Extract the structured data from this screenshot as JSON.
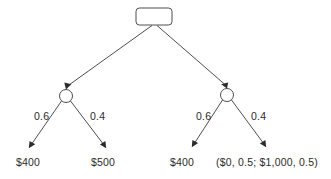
{
  "diagram": {
    "type": "decision-tree",
    "background_color": "#ffffff",
    "line_color": "#3a3a3a",
    "text_color": "#2b2b2b",
    "root": {
      "shape": "rounded-rectangle",
      "role": "decision-node",
      "label": "",
      "x": 154,
      "y": 16.5,
      "width": 36,
      "height": 17
    },
    "chance_nodes": [
      {
        "id": "left-chance-node",
        "shape": "circle",
        "x": 66,
        "y": 96,
        "r": 6.5
      },
      {
        "id": "right-chance-node",
        "shape": "circle",
        "x": 227,
        "y": 95,
        "r": 6.5
      }
    ],
    "main_branches": [
      {
        "from": "root",
        "to": "left-chance-node",
        "label": ""
      },
      {
        "from": "root",
        "to": "right-chance-node",
        "label": ""
      }
    ],
    "probabilities": {
      "left_upper": "0.6",
      "left_lower": "0.4",
      "right_upper": "0.6",
      "right_lower": "0.4"
    },
    "outcomes": [
      {
        "id": "outcome-1",
        "text": "$400",
        "parent": "left-chance-node",
        "probability": "0.6"
      },
      {
        "id": "outcome-2",
        "text": "$500",
        "parent": "left-chance-node",
        "probability": "0.4"
      },
      {
        "id": "outcome-3",
        "text": "$400",
        "parent": "right-chance-node",
        "probability": "0.6"
      },
      {
        "id": "outcome-4",
        "text": "($0, 0.5; $1,000, 0.5)",
        "parent": "right-chance-node",
        "probability": "0.4"
      }
    ]
  }
}
